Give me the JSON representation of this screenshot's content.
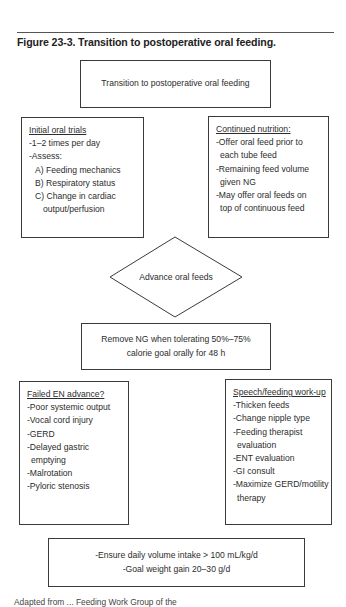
{
  "figure": {
    "title": "Figure 23-3. Transition to postoperative oral feeding."
  },
  "nodes": {
    "start": {
      "text": "Transition to postoperative oral feeding"
    },
    "initial_trials": {
      "heading": "Initial oral trials",
      "items": [
        "-1–2 times per day",
        "-Assess:",
        "A) Feeding mechanics",
        "B) Respiratory status",
        "C) Change in cardiac",
        "output/perfusion"
      ]
    },
    "continued_nutrition": {
      "heading": "Continued nutrition:",
      "items": [
        "-Offer oral feed prior to",
        "each tube feed",
        "-Remaining feed volume",
        "given NG",
        "-May offer oral feeds on",
        "top of continuous feed"
      ]
    },
    "advance": {
      "text": "Advance oral feeds"
    },
    "remove_ng": {
      "line1": "Remove NG when tolerating 50%–75%",
      "line2": "calorie goal orally for 48 h"
    },
    "failed_en": {
      "heading": "Failed EN advance?",
      "items": [
        "-Poor systemic output",
        "-Vocal cord injury",
        "-GERD",
        "-Delayed gastric",
        "emptying",
        "-Malrotation",
        "-Pyloric stenosis"
      ]
    },
    "speech_feeding": {
      "heading": "Speech/feeding work-up",
      "items": [
        "-Thicken feeds",
        "-Change nipple type",
        "-Feeding therapist",
        "evaluation",
        "-ENT evaluation",
        "-GI consult",
        "-Maximize GERD/motility",
        "therapy"
      ]
    },
    "goals": {
      "line1": "-Ensure daily volume intake > 100 mL/kg/d",
      "line2": "-Goal weight gain 20–30 g/d"
    }
  },
  "footnote": {
    "text": "Adapted from ... Feeding Work Group of the"
  },
  "colors": {
    "border": "#3a3a3a",
    "text": "#2c2c2c",
    "background": "#ffffff"
  }
}
